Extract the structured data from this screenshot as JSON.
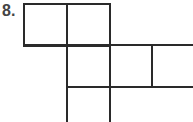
{
  "problem": {
    "number": "8.",
    "description": "Grid net diagram of squares",
    "line_color": "#2a2a2a"
  }
}
